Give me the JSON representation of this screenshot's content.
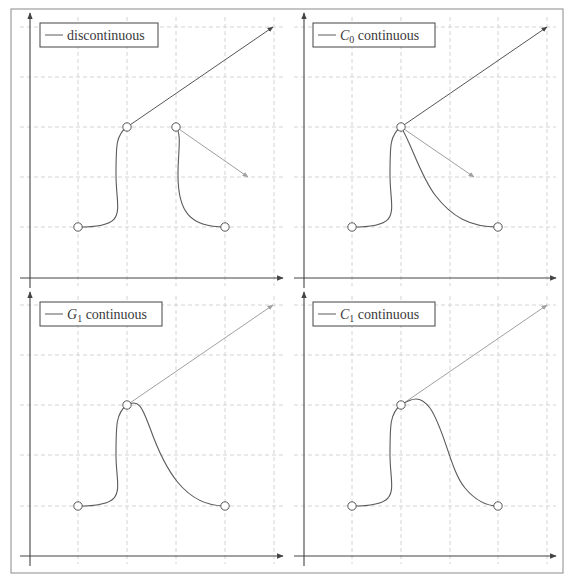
{
  "figure": {
    "frame": {
      "x": 11,
      "y": 9,
      "w": 552,
      "h": 564,
      "stroke": "#8a8a8a"
    },
    "colors": {
      "axis": "#444444",
      "grid": "#d4d4d4",
      "curve": "#5a5a5a",
      "tangent_dark": "#555555",
      "tangent_light": "#a0a0a0",
      "point_fill": "#ffffff",
      "point_stroke": "#555555"
    }
  },
  "panels": [
    {
      "id": "discontinuous",
      "legend_label": "discontinuous",
      "legend_math": "",
      "legend_sub": "",
      "origin": {
        "x": 30,
        "y": 278
      },
      "axis_x_end": 283,
      "axis_y_end": 13,
      "legend_box": {
        "x": 40,
        "y": 23,
        "w": 118,
        "h": 24
      },
      "grid_cols": [
        78,
        127,
        176,
        225,
        274
      ],
      "grid_rows": [
        27,
        77,
        127,
        177,
        227
      ],
      "curves": [
        "M 78 227 C 130 227, 116 212, 116 175 C 116 145, 116 135, 127 127",
        "M 176 127 C 182 135, 178 150, 178 175 C 178 212, 190 227, 225 227"
      ],
      "tangents": [
        {
          "x1": 127,
          "y1": 127,
          "x2": 273,
          "y2": 27,
          "tone": "dark"
        },
        {
          "x1": 176,
          "y1": 127,
          "x2": 248,
          "y2": 177,
          "tone": "light"
        }
      ],
      "points": [
        [
          78,
          227
        ],
        [
          127,
          127
        ],
        [
          176,
          127
        ],
        [
          225,
          227
        ]
      ]
    },
    {
      "id": "c0",
      "legend_label": " continuous",
      "legend_math": "C",
      "legend_sub": "0",
      "origin": {
        "x": 304,
        "y": 278
      },
      "axis_x_end": 556,
      "axis_y_end": 13,
      "legend_box": {
        "x": 313,
        "y": 23,
        "w": 122,
        "h": 24
      },
      "grid_cols": [
        352,
        401,
        450,
        498,
        547
      ],
      "grid_rows": [
        27,
        77,
        127,
        177,
        227
      ],
      "curves": [
        "M 352 227 C 404 227, 390 212, 390 175 C 390 145, 390 135, 401 127",
        "M 401 127 C 412 145, 420 175, 435 195 C 452 217, 470 227, 498 227"
      ],
      "tangents": [
        {
          "x1": 401,
          "y1": 127,
          "x2": 547,
          "y2": 27,
          "tone": "dark"
        },
        {
          "x1": 401,
          "y1": 127,
          "x2": 474,
          "y2": 177,
          "tone": "light"
        }
      ],
      "points": [
        [
          352,
          227
        ],
        [
          401,
          127
        ],
        [
          498,
          227
        ]
      ]
    },
    {
      "id": "g1",
      "legend_label": " continuous",
      "legend_math": "G",
      "legend_sub": "1",
      "origin": {
        "x": 30,
        "y": 556
      },
      "axis_x_end": 283,
      "axis_y_end": 292,
      "legend_box": {
        "x": 40,
        "y": 302,
        "w": 122,
        "h": 24
      },
      "grid_cols": [
        78,
        127,
        176,
        225,
        274
      ],
      "grid_rows": [
        305,
        355,
        405,
        455,
        506
      ],
      "curves": [
        "M 78 506 C 130 506, 116 490, 116 455 C 116 425, 116 413, 127 405",
        "M 127 405 C 140 398, 143 410, 150 428 C 165 470, 185 506, 225 506"
      ],
      "tangents": [
        {
          "x1": 127,
          "y1": 405,
          "x2": 273,
          "y2": 305,
          "tone": "light"
        }
      ],
      "points": [
        [
          78,
          506
        ],
        [
          127,
          405
        ],
        [
          225,
          506
        ]
      ]
    },
    {
      "id": "c1",
      "legend_label": " continuous",
      "legend_math": "C",
      "legend_sub": "1",
      "origin": {
        "x": 304,
        "y": 556
      },
      "axis_x_end": 556,
      "axis_y_end": 292,
      "legend_box": {
        "x": 313,
        "y": 302,
        "w": 122,
        "h": 24
      },
      "grid_cols": [
        352,
        401,
        450,
        498,
        547
      ],
      "grid_rows": [
        305,
        355,
        405,
        455,
        506
      ],
      "curves": [
        "M 352 506 C 404 506, 390 490, 390 455 C 390 425, 390 413, 401 405",
        "M 401 405 C 412 398, 420 395, 430 408 C 445 430, 450 470, 465 488 C 475 500, 485 506, 498 506"
      ],
      "tangents": [
        {
          "x1": 401,
          "y1": 405,
          "x2": 547,
          "y2": 305,
          "tone": "light"
        }
      ],
      "points": [
        [
          352,
          506
        ],
        [
          401,
          405
        ],
        [
          498,
          506
        ]
      ]
    }
  ]
}
